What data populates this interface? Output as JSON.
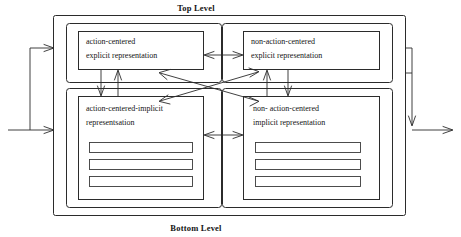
{
  "diagram": {
    "title_top": "Top Level",
    "title_bottom": "Bottom Level",
    "boxes": {
      "top_left": {
        "line1": "action-centered",
        "line2": "explicit representation"
      },
      "top_right": {
        "line1": "non-action-centered",
        "line2": "explicit  representation"
      },
      "bottom_left": {
        "line1": "action-centered-implicit",
        "line2": "representsation"
      },
      "bottom_right": {
        "line1": "non- action-centered",
        "line2": "implicit  representation"
      }
    },
    "slot_count": 3,
    "colors": {
      "stroke": "#2b2b2b",
      "text": "#141414",
      "background": "#ffffff"
    }
  }
}
